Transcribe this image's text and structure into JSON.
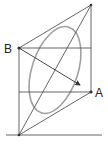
{
  "diagram": {
    "labels": {
      "a": "A",
      "b": "B"
    },
    "colors": {
      "line": "#555555",
      "arc": "#9a9a9a",
      "text": "#222222"
    }
  }
}
